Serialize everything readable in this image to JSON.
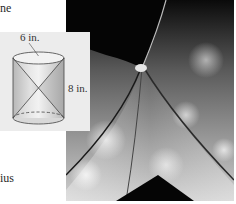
{
  "text_fragments": {
    "top_left": "ne",
    "bottom_left": "ius"
  },
  "figure": {
    "shape": "cylinder with two inscribed cones (hourglass)",
    "diameter_label": "6 in.",
    "height_label": "8 in."
  },
  "photo": {
    "subject": "hourglass",
    "style": "black-and-white"
  },
  "colors": {
    "inset_background": "#ececec",
    "cylinder_fill": "#d4d4d4",
    "cone_fill": "#bdbdbd",
    "outline": "#444444"
  }
}
